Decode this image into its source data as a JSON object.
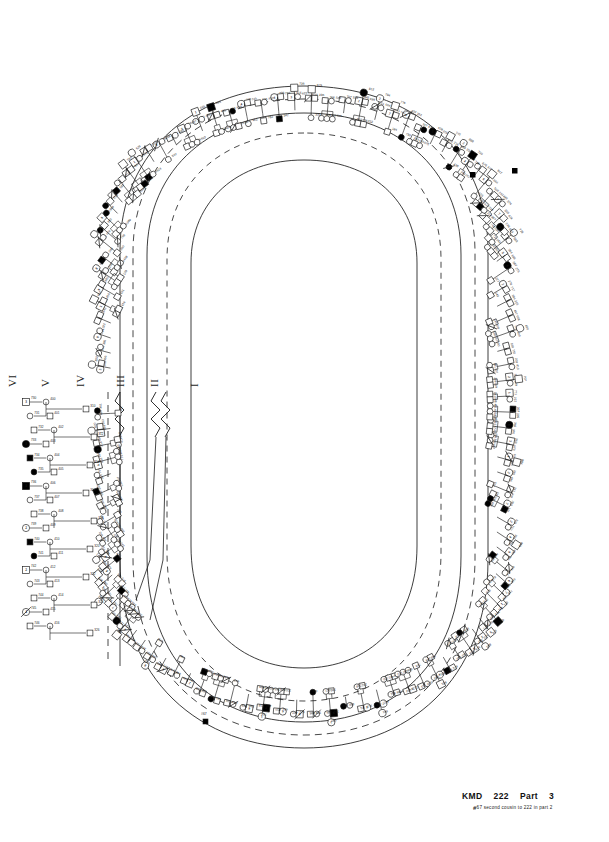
{
  "document": {
    "type": "pedigree-chart",
    "layout": "oval-radial",
    "background_color": "#ffffff",
    "ink_color": "#1a1a1a"
  },
  "generations": {
    "orientation": "rotated-90",
    "labels": [
      {
        "numeral": "VI",
        "x": 6
      },
      {
        "numeral": "V",
        "x": 39
      },
      {
        "numeral": "IV",
        "x": 74
      },
      {
        "numeral": "III",
        "x": 114
      },
      {
        "numeral": "II",
        "x": 148
      },
      {
        "numeral": "I",
        "x": 188
      }
    ]
  },
  "caption": {
    "family_code": "KMD",
    "family_number": "222",
    "part_label": "Part",
    "part_number": "3",
    "footnote_marker": "#",
    "footnote_text": "67  second  cousin  to  222  in  part 2"
  },
  "legend": {
    "male_symbol": "square",
    "female_symbol": "circle",
    "affected_fill": "#000000",
    "unaffected_fill": "#ffffff",
    "deceased_mark": "diagonal-slash",
    "proband_marker": "filled-dot",
    "line_break_mark": "zigzag"
  },
  "chart_data": {
    "type": "pedigree",
    "title": "KMD 222 Part 3",
    "ring_count": 4,
    "note": "Symbols are drawn radially around an oval; circled numerals mark sibship identifiers and small numerals are individual ID codes."
  }
}
